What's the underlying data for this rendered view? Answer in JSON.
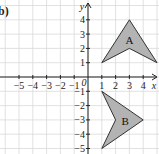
{
  "part_label": "b)",
  "axes": {
    "x_label": "x",
    "y_label": "y",
    "origin_label": "0",
    "x_ticks": [
      "-5",
      "-4",
      "-3",
      "-2",
      "-1",
      "1",
      "2",
      "3",
      "4"
    ],
    "y_ticks": [
      "4",
      "3",
      "2",
      "1",
      "-1",
      "-2",
      "-3",
      "-4",
      "-5"
    ]
  },
  "shapes": [
    {
      "label": "A",
      "vertices": [
        [
          1,
          1
        ],
        [
          3,
          4
        ],
        [
          5,
          1
        ],
        [
          3,
          2
        ]
      ],
      "fill": "#b3b3b3"
    },
    {
      "label": "B",
      "vertices": [
        [
          1,
          -1
        ],
        [
          4,
          -3
        ],
        [
          1,
          -5
        ],
        [
          2,
          -3
        ]
      ],
      "fill": "#b3b3b3"
    }
  ],
  "colors": {
    "grid": "#d9d9d9",
    "axis": "#222222",
    "shape_stroke": "#333333"
  }
}
